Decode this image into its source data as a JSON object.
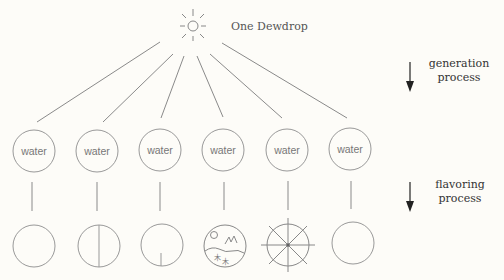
{
  "diagram": {
    "title": "One Dewdrop",
    "source_icon": "sun-icon",
    "generation_label": [
      "generation",
      "process"
    ],
    "flavoring_label": [
      "flavoring",
      "process"
    ],
    "water_nodes": [
      {
        "label": "water"
      },
      {
        "label": "water"
      },
      {
        "label": "water"
      },
      {
        "label": "water"
      },
      {
        "label": "water"
      },
      {
        "label": "water"
      }
    ],
    "flavored_nodes": [
      {
        "icon": "empty-circle-icon"
      },
      {
        "icon": "circle-vertical-divider-icon"
      },
      {
        "icon": "circle-short-stem-icon"
      },
      {
        "icon": "landscape-circle-icon"
      },
      {
        "icon": "star-circle-icon"
      },
      {
        "icon": "empty-circle-icon"
      }
    ],
    "colors": {
      "background": "#fdfcf8",
      "line": "#8a8a8a",
      "arrow": "#222222",
      "text": "#555555"
    }
  }
}
